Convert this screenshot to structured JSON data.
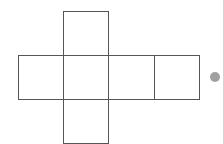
{
  "diagram": {
    "type": "cube-net",
    "stroke_color": "#555555",
    "dot_color": "#a0a0a0",
    "squares": [
      {
        "id": "top",
        "x": 63,
        "y": 11,
        "w": 45,
        "h": 44
      },
      {
        "id": "left",
        "x": 18,
        "y": 55,
        "w": 45,
        "h": 44
      },
      {
        "id": "center",
        "x": 63,
        "y": 55,
        "w": 45,
        "h": 44
      },
      {
        "id": "right",
        "x": 108,
        "y": 55,
        "w": 46,
        "h": 44
      },
      {
        "id": "far-right",
        "x": 154,
        "y": 55,
        "w": 45,
        "h": 44
      },
      {
        "id": "bottom",
        "x": 63,
        "y": 99,
        "w": 45,
        "h": 44
      }
    ],
    "dot": {
      "cx": 215,
      "cy": 77,
      "r": 5
    }
  }
}
